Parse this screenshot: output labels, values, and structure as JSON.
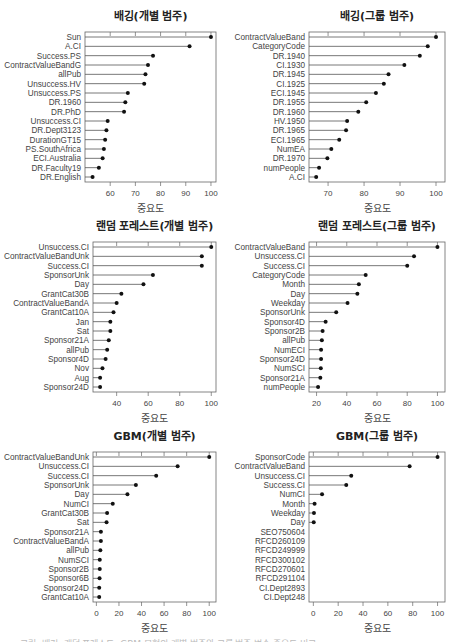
{
  "figure": {
    "x_axis_label": "중요도",
    "caption_clipped": "그림: 배깅, 랜덤 포레스트, GBM 모형의 개별 범주와 그룹 범주 변수 중요도 비교"
  },
  "chart_data": [
    {
      "type": "dot",
      "title": "배깅(개별 범주)",
      "xlabel": "중요도",
      "ylabel": "",
      "xlim": [
        50,
        102
      ],
      "xticks": [
        60,
        70,
        80,
        90,
        100
      ],
      "grid": false,
      "legend": null,
      "categories": [
        "Sun",
        "A.CI",
        "Success.PS",
        "ContractValueBandG",
        "allPub",
        "Unsuccess.HV",
        "Unsuccess.PS",
        "DR.1960",
        "DR.PhD",
        "Unsuccess.CI",
        "DR.Dept3123",
        "DurationGT15",
        "PS.SouthAfrica",
        "ECI.Australia",
        "DR.Faculty19",
        "DR.English"
      ],
      "values": [
        100,
        91.5,
        77,
        75,
        74,
        73.5,
        67,
        66,
        65.5,
        59,
        58.5,
        58,
        57.5,
        57,
        55.5,
        53
      ]
    },
    {
      "type": "dot",
      "title": "배깅(그룹 범주)",
      "xlabel": "중요도",
      "ylabel": "",
      "xlim": [
        64.7,
        102.5
      ],
      "xticks": [
        70,
        80,
        90,
        100
      ],
      "grid": false,
      "legend": null,
      "categories": [
        "ContractValueBand",
        "CategoryCode",
        "DR.1940",
        "CI.1930",
        "DR.1945",
        "CI.1925",
        "ECI.1945",
        "DR.1955",
        "DR.1960",
        "HV.1950",
        "DR.1965",
        "ECI.1965",
        "NumEA",
        "DR.1970",
        "numPeople",
        "A.CI"
      ],
      "values": [
        100,
        97.7,
        95.5,
        91.2,
        86.8,
        85.5,
        83.3,
        80.6,
        78.4,
        75.3,
        75,
        73.1,
        70.9,
        69.8,
        67.5,
        66.7
      ]
    },
    {
      "type": "dot",
      "title": "랜덤 포레스트(개별 범주)",
      "xlabel": "중요도",
      "ylabel": "",
      "xlim": [
        25,
        103
      ],
      "xticks": [
        40,
        60,
        80,
        100
      ],
      "grid": false,
      "legend": null,
      "categories": [
        "Unsuccess.CI",
        "ContractValueBandUnk",
        "Success.CI",
        "SponsorUnk",
        "Day",
        "GrantCat30B",
        "ContractValueBandA",
        "GrantCat10A",
        "Jan",
        "Sat",
        "Sponsor21A",
        "allPub",
        "Sponsor4D",
        "Nov",
        "Aug",
        "Sponsor24D"
      ],
      "values": [
        100,
        94,
        94,
        63,
        57,
        43,
        40,
        38,
        36,
        36,
        35,
        34,
        33,
        31,
        29.5,
        29.5
      ]
    },
    {
      "type": "dot",
      "title": "랜덤 포레스트(그룹 범주)",
      "xlabel": "중요도",
      "ylabel": "",
      "xlim": [
        15,
        105
      ],
      "xticks": [
        20,
        40,
        60,
        80,
        100
      ],
      "grid": false,
      "legend": null,
      "categories": [
        "ContractValueBand",
        "Unsuccess.CI",
        "Success.CI",
        "CategoryCode",
        "Month",
        "Day",
        "Weekday",
        "SponsorUnk",
        "Sponsor4D",
        "Sponsor2B",
        "allPub",
        "NumECI",
        "Sponsor24D",
        "NumSCI",
        "Sponsor21A",
        "numPeople"
      ],
      "values": [
        100,
        84.5,
        80,
        52.5,
        48,
        47,
        40.5,
        33,
        26,
        24,
        23.5,
        23,
        23,
        22.8,
        22.5,
        21
      ]
    },
    {
      "type": "dot",
      "title": "GBM(개별 범주)",
      "xlabel": "중요도",
      "ylabel": "",
      "xlim": [
        -3,
        106
      ],
      "xticks": [
        0,
        20,
        40,
        60,
        80,
        100
      ],
      "grid": false,
      "legend": null,
      "categories": [
        "ContractValueBandUnk",
        "Unsuccess.CI",
        "Success.CI",
        "SponsorUnk",
        "Day",
        "NumCI",
        "GrantCat30B",
        "Sat",
        "Sponsor21A",
        "ContractValueBandA",
        "allPub",
        "NumSCI",
        "Sponsor2B",
        "Sponsor6B",
        "Sponsor24D",
        "GrantCat10A"
      ],
      "values": [
        100,
        72,
        53,
        35,
        27.5,
        14.5,
        9.5,
        9,
        4,
        4,
        3.5,
        3,
        3,
        2.8,
        2.5,
        2.5
      ]
    },
    {
      "type": "dot",
      "title": "GBM(그룹 범주)",
      "xlabel": "중요도",
      "ylabel": "",
      "xlim": [
        -3.5,
        106
      ],
      "xticks": [
        0,
        20,
        40,
        60,
        80,
        100
      ],
      "grid": false,
      "legend": null,
      "categories": [
        "SponsorCode",
        "ContractValueBand",
        "Unsuccess.CI",
        "Success.CI",
        "NumCI",
        "Month",
        "Weekday",
        "Day",
        "SEO750604",
        "RFCD260109",
        "RFCD249999",
        "RFCD300102",
        "RFCD270601",
        "RFCD291104",
        "CI.Dept2893",
        "CI.Dept248"
      ],
      "values": [
        100,
        77.5,
        30.5,
        26.5,
        7,
        1,
        0.5,
        0.3,
        null,
        null,
        null,
        null,
        null,
        null,
        null,
        null
      ]
    }
  ],
  "layout": {
    "panels": [
      {
        "left": 0,
        "top": 0,
        "box_x": 85,
        "box_y": 32,
        "box_w": 131,
        "box_h": 150
      },
      {
        "left": 228,
        "top": 0,
        "box_x": 81,
        "box_y": 32,
        "box_w": 136,
        "box_h": 150
      },
      {
        "left": 0,
        "top": 210,
        "box_x": 93,
        "box_y": 32,
        "box_w": 123,
        "box_h": 150
      },
      {
        "left": 228,
        "top": 210,
        "box_x": 81,
        "box_y": 32,
        "box_w": 136,
        "box_h": 150
      },
      {
        "left": 0,
        "top": 420,
        "box_x": 93,
        "box_y": 32,
        "box_w": 123,
        "box_h": 150
      },
      {
        "left": 228,
        "top": 420,
        "box_x": 81,
        "box_y": 32,
        "box_w": 136,
        "box_h": 150
      }
    ],
    "panel_width": 229,
    "panel_height": 212,
    "line_color": "#555555",
    "dot_color": "#111111",
    "box_color": "#666666"
  }
}
